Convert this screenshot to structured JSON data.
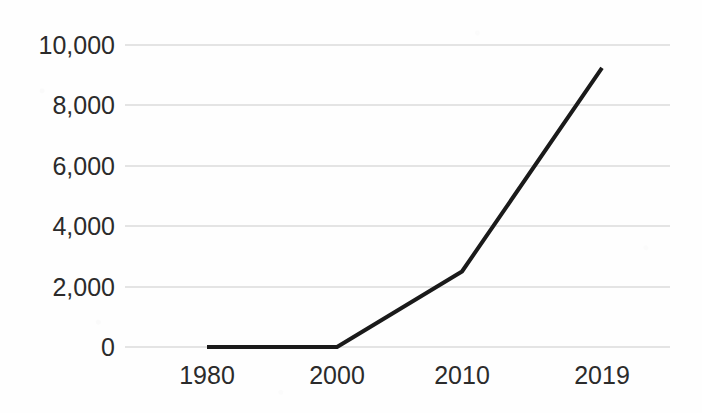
{
  "chart_data": {
    "type": "line",
    "title": "",
    "subtitle": "",
    "xlabel": "",
    "ylabel": "",
    "categories": [
      "1980",
      "2000",
      "2010",
      "2019"
    ],
    "values": [
      0,
      0,
      2500,
      9240
    ],
    "series": [
      {
        "name": "",
        "values": [
          0,
          0,
          2500,
          9240
        ]
      }
    ],
    "ylim": [
      0,
      10000
    ],
    "y_ticks": [
      0,
      2000,
      4000,
      6000,
      8000,
      10000
    ],
    "y_tick_labels": [
      "0",
      "2,000",
      "4,000",
      "6,000",
      "8,000",
      "10,000"
    ],
    "x_tick_labels": [
      "1980",
      "2000",
      "2010",
      "2019"
    ],
    "grid": true,
    "grid_axis": "y",
    "legend": false,
    "legend_position": "none",
    "line_color": "#1a1a1a",
    "line_width": 4,
    "grid_color": "#c9c9c9",
    "background_color": "#fefefe",
    "text_color": "#2b2b2b",
    "markers": false
  },
  "geometry": {
    "plot_left": 125,
    "plot_right": 670,
    "y_pixel_for_zero": 347,
    "y_pixel_for_max": 45,
    "category_x_pixels": [
      207,
      337,
      462,
      602
    ],
    "y_tick_pixels": [
      347,
      287,
      226,
      166,
      105,
      45
    ],
    "x_label_y_pixel": 384
  }
}
